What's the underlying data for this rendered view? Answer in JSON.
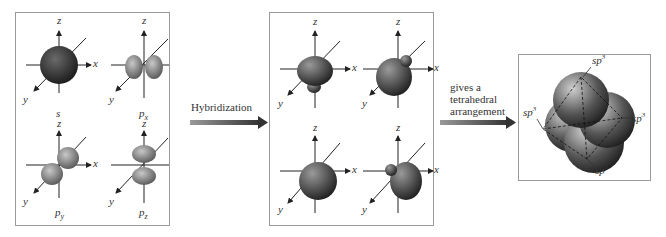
{
  "panels": {
    "atomic_orbitals": {
      "orbitals": [
        {
          "name": "s",
          "sub": ""
        },
        {
          "name": "p",
          "sub": "x"
        },
        {
          "name": "p",
          "sub": "y"
        },
        {
          "name": "p",
          "sub": "z"
        }
      ],
      "axes": {
        "x": "x",
        "y": "y",
        "z": "z"
      }
    },
    "hybrid_orbitals": {
      "count": 4,
      "axes": {
        "x": "x",
        "y": "y",
        "z": "z"
      }
    },
    "tetrahedral": {
      "labels": [
        "sp3",
        "sp3",
        "sp3",
        "sp3"
      ],
      "label_base": "sp",
      "label_sup": "3"
    }
  },
  "arrows": {
    "hybridization": "Hybridization",
    "arrangement_lines": [
      "gives a",
      "tetrahedral",
      "arrangement"
    ]
  },
  "colors": {
    "border": "#9a9a9a",
    "arrow_dark": "#3a3a3a",
    "arrow_light": "#8a8a8a",
    "orbital_dark": "#2b2b2b",
    "orbital_mid": "#6d6d6d",
    "orbital_light": "#b8b8b8"
  }
}
